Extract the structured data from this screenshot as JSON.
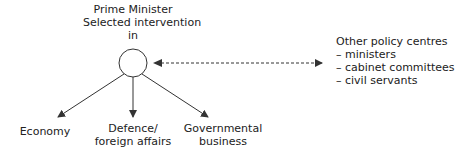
{
  "center_node": {
    "title_line1": "Prime Minister",
    "title_line2": "Selected intervention",
    "title_line3": "in"
  },
  "targets": [
    {
      "line1": "Economy",
      "line2": ""
    },
    {
      "line1": "Defence/",
      "line2": "foreign affairs"
    },
    {
      "line1": "Governmental",
      "line2": "business"
    }
  ],
  "other_centres": {
    "heading": "Other policy centres",
    "items": [
      "– ministers",
      "– cabinet committees",
      "– civil servants"
    ]
  },
  "colors": {
    "stroke": "#333333",
    "text": "#222222"
  }
}
